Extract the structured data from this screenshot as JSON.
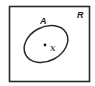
{
  "diagram": {
    "type": "venn-diagram",
    "universal_set": {
      "label": "R",
      "shape": "rectangle",
      "stroke_color": "#2a2a2a"
    },
    "sets": [
      {
        "label": "A",
        "shape": "ellipse",
        "stroke_color": "#2a2a2a"
      }
    ],
    "points": [
      {
        "label": "x",
        "member_of": "A",
        "color": "#1a1a1a"
      }
    ]
  }
}
